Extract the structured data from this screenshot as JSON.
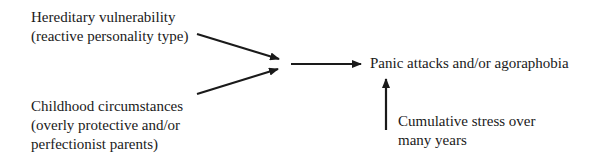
{
  "diagram": {
    "nodes": [
      {
        "id": "hereditary",
        "lines": [
          "Hereditary vulnerability",
          "(reactive personality type)"
        ]
      },
      {
        "id": "childhood",
        "lines": [
          "Childhood circumstances",
          "(overly protective and/or",
          "perfectionist parents)"
        ]
      },
      {
        "id": "outcome",
        "lines": [
          "Panic attacks and/or agoraphobia"
        ]
      },
      {
        "id": "stress",
        "lines": [
          "Cumulative stress over",
          "many years"
        ]
      }
    ],
    "edges": [
      {
        "from": "hereditary",
        "to": "junction"
      },
      {
        "from": "childhood",
        "to": "junction"
      },
      {
        "from": "junction",
        "to": "outcome"
      },
      {
        "from": "stress",
        "to": "outcome"
      }
    ],
    "colors": {
      "line": "#1a1a1a",
      "text": "#1a1a1a",
      "background": "#ffffff"
    }
  }
}
